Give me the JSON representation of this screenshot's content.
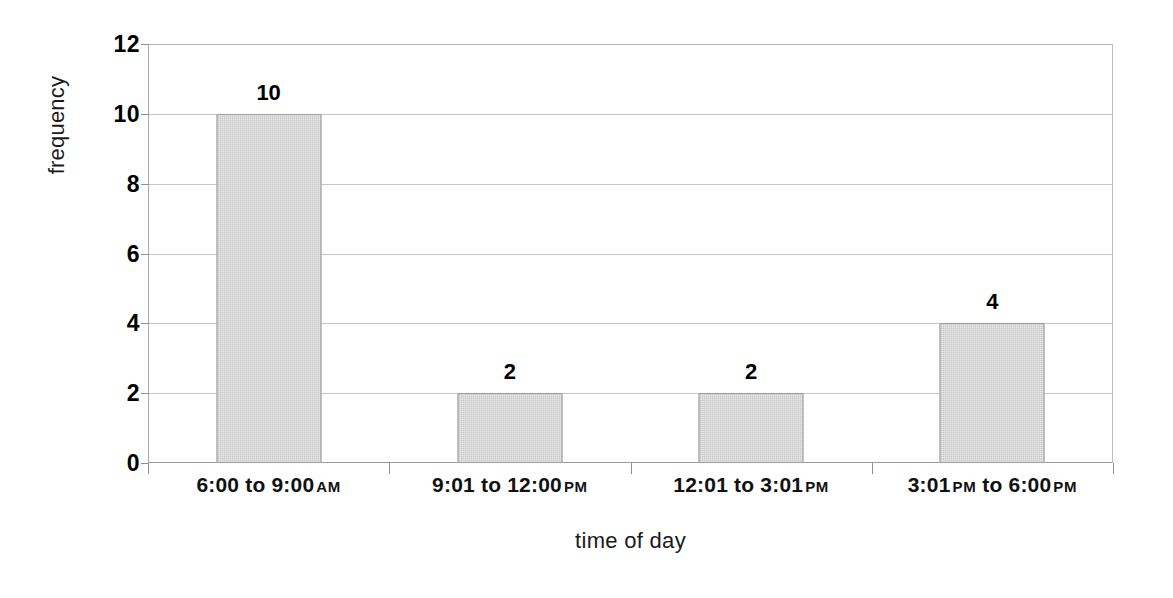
{
  "chart_data": {
    "type": "bar",
    "title": "",
    "xlabel": "time of day",
    "ylabel": "frequency",
    "categories": [
      "6:00 to 9:00 AM",
      "9:01 to 12:00 PM",
      "12:01 to 3:01 PM",
      "3:01 PM to 6:00 PM"
    ],
    "category_parts": [
      {
        "main": "6:00 to 9:00",
        "suffix": "AM"
      },
      {
        "main": "9:01 to 12:00",
        "suffix": "PM"
      },
      {
        "main": "12:01 to 3:01",
        "suffix": "PM"
      },
      {
        "main": "3:01",
        "mid": "PM",
        "main2": "to 6:00",
        "suffix": "PM"
      }
    ],
    "values": [
      10,
      2,
      2,
      4
    ],
    "data_labels": [
      "10",
      "2",
      "2",
      "4"
    ],
    "ylim": [
      0,
      12
    ],
    "yticks": [
      0,
      2,
      4,
      6,
      8,
      10,
      12
    ],
    "ytick_labels": [
      "0",
      "2",
      "4",
      "6",
      "8",
      "10",
      "12"
    ],
    "grid": true,
    "legend": "none",
    "bar_fill_color": "#c9c9c9",
    "bar_edge_color": "#9e9e9e",
    "gridline_color": "#c4c4c4",
    "background_color": "#ffffff"
  }
}
